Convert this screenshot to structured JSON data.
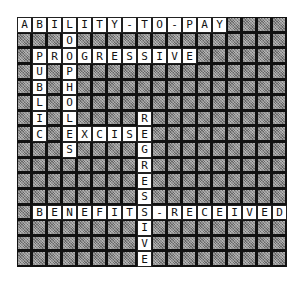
{
  "puzzle": {
    "rows": 16,
    "cols": 18,
    "colors": {
      "block": "#8a8a8a",
      "letter_bg": "#ffffff",
      "grid_line": "#111111"
    },
    "words": [
      {
        "word": "ABILITY-TO-PAY",
        "row": 0,
        "col": 0,
        "dir": "across"
      },
      {
        "word": "LOOPHOLES",
        "row": 0,
        "col": 3,
        "dir": "down"
      },
      {
        "word": "PROGRESSIVE",
        "row": 2,
        "col": 1,
        "dir": "across"
      },
      {
        "word": "PUBLIC",
        "row": 2,
        "col": 1,
        "dir": "down"
      },
      {
        "word": "EXCISE",
        "row": 7,
        "col": 3,
        "dir": "across"
      },
      {
        "word": "REGRESSIVE",
        "row": 6,
        "col": 8,
        "dir": "down"
      },
      {
        "word": "BENEFITS-RECEIVED",
        "row": 12,
        "col": 1,
        "dir": "across"
      }
    ]
  },
  "cells": []
}
